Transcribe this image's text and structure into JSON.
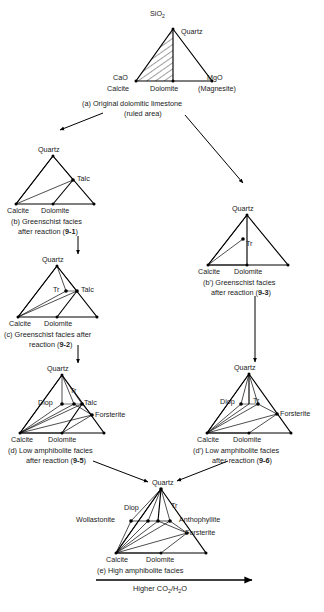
{
  "figure": {
    "bottom_axis_label_parts": {
      "pre": "Higher CO",
      "sub1": "2",
      "mid": "/H",
      "sub2": "2",
      "post": "O"
    },
    "bottom_axis_label": "Higher CO2/H2O"
  },
  "diagrams": {
    "a": {
      "id": "a",
      "caption_line1": "(a) Original dolomitic limestone",
      "caption_line2": "(ruled area)",
      "vertices": {
        "apex_formula": "SiO",
        "apex_formula_sub": "2",
        "apex_mineral": "Quartz",
        "left_formula": "CaO",
        "left_mineral": "Calcite",
        "right_formula": "MgO",
        "right_mineral": "(Magnesite)",
        "base_mid_mineral": "Dolomite"
      },
      "shaded_region": "ruled area"
    },
    "b": {
      "id": "b",
      "caption_line1": "(b) Greenschist facies",
      "caption_line2_pre": "after reaction (",
      "caption_line2_ref": "9-1",
      "caption_line2_post": ")",
      "caption_line2": "after reaction (9-1)",
      "vertices": {
        "apex": "Quartz",
        "left": "Calcite",
        "base_mid": "Dolomite",
        "interior": "Talc"
      }
    },
    "bprime": {
      "id": "b'",
      "caption_line1": "(b') Greenschist facies",
      "caption_line2_pre": "after reaction (",
      "caption_line2_ref": "9-3",
      "caption_line2_post": ")",
      "caption_line2": "after reaction (9-3)",
      "vertices": {
        "apex": "Quartz",
        "left": "Calcite",
        "base_mid": "Dolomite",
        "interior": "Tr"
      }
    },
    "c": {
      "id": "c",
      "caption_line1": "(c) Greenschist facies after",
      "caption_line2_pre": "reaction (",
      "caption_line2_ref": "9-2",
      "caption_line2_post": ")",
      "caption_line2": "reaction (9-2)",
      "vertices": {
        "apex": "Quartz",
        "left": "Calcite",
        "base_mid": "Dolomite",
        "interior_1": "Tr",
        "interior_2": "Talc"
      }
    },
    "d": {
      "id": "d",
      "caption_line1": "(d) Low amphibolite facies",
      "caption_line2_pre": "after reaction (",
      "caption_line2_ref": "9-5",
      "caption_line2_post": ")",
      "caption_line2": "after reaction (9-5)",
      "vertices": {
        "apex": "Quartz",
        "left": "Calcite",
        "base_mid": "Dolomite",
        "interior_1": "Diop",
        "interior_2": "Tr",
        "interior_3": "Talc",
        "interior_4": "Forsterite"
      }
    },
    "dprime": {
      "id": "d'",
      "caption_line1": "(d') Low amphibolite facies",
      "caption_line2_pre": "after reaction (",
      "caption_line2_ref": "9-6",
      "caption_line2_post": ")",
      "caption_line2": "after reaction (9-6)",
      "vertices": {
        "apex": "Quartz",
        "left": "Calcite",
        "base_mid": "Dolomite",
        "interior_1": "Diop",
        "interior_2": "Tr",
        "interior_3": "Forsterite"
      }
    },
    "e": {
      "id": "e",
      "caption_line1": "(e) High amphibolite facies",
      "vertices": {
        "apex": "Quartz",
        "left": "Calcite",
        "base_mid": "Dolomite",
        "interior_1": "Diop",
        "interior_2": "Tr",
        "interior_3": "Wollastonite",
        "interior_4": "Anthophyllite",
        "interior_5": "Forsterite"
      }
    }
  },
  "colors": {
    "background": "#ffffff",
    "ink": "#000000",
    "text": "#111111"
  }
}
